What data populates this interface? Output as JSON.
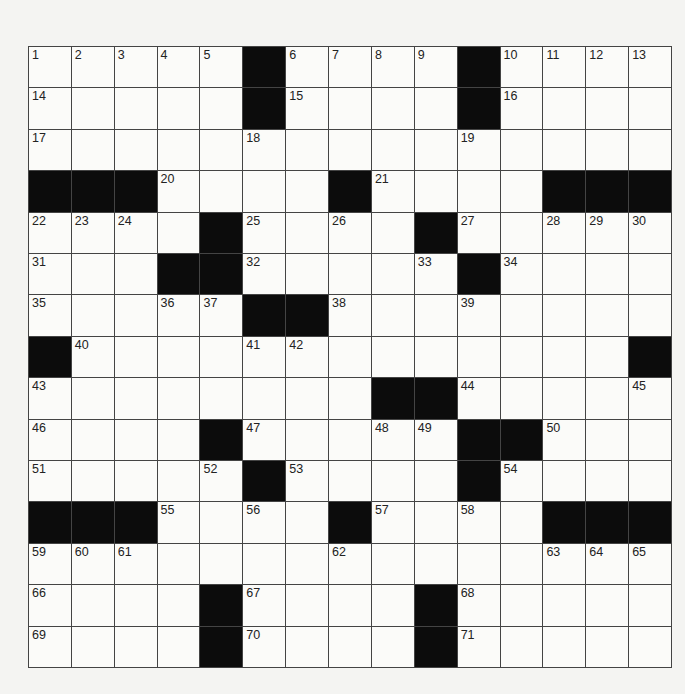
{
  "puzzle": {
    "rows": 15,
    "cols": 15,
    "blacks": [
      [
        5,
        10
      ],
      [
        5,
        10
      ],
      [],
      [
        0,
        1,
        2,
        7,
        12,
        13,
        14
      ],
      [
        4,
        9
      ],
      [
        3,
        4,
        10
      ],
      [
        5,
        6
      ],
      [
        0,
        14
      ],
      [
        8,
        9
      ],
      [
        4,
        10,
        11
      ],
      [
        5,
        10
      ],
      [
        0,
        1,
        2,
        7,
        12,
        13,
        14
      ],
      [],
      [
        4,
        9
      ],
      [
        4,
        9
      ]
    ],
    "numbers": [
      [
        [
          0,
          1
        ],
        [
          1,
          2
        ],
        [
          2,
          3
        ],
        [
          3,
          4
        ],
        [
          4,
          5
        ],
        [
          6,
          6
        ],
        [
          7,
          7
        ],
        [
          8,
          8
        ],
        [
          9,
          9
        ],
        [
          11,
          10
        ],
        [
          12,
          11
        ],
        [
          13,
          12
        ],
        [
          14,
          13
        ]
      ],
      [
        [
          0,
          14
        ],
        [
          6,
          15
        ],
        [
          11,
          16
        ]
      ],
      [
        [
          0,
          17
        ],
        [
          5,
          18
        ],
        [
          10,
          19
        ]
      ],
      [
        [
          3,
          20
        ],
        [
          8,
          21
        ]
      ],
      [
        [
          0,
          22
        ],
        [
          1,
          23
        ],
        [
          2,
          24
        ],
        [
          5,
          25
        ],
        [
          7,
          26
        ],
        [
          10,
          27
        ],
        [
          12,
          28
        ],
        [
          13,
          29
        ],
        [
          14,
          30
        ]
      ],
      [
        [
          0,
          31
        ],
        [
          5,
          32
        ],
        [
          9,
          33
        ],
        [
          11,
          34
        ]
      ],
      [
        [
          0,
          35
        ],
        [
          3,
          36
        ],
        [
          4,
          37
        ],
        [
          7,
          38
        ],
        [
          10,
          39
        ]
      ],
      [
        [
          1,
          40
        ],
        [
          5,
          41
        ],
        [
          6,
          42
        ]
      ],
      [
        [
          0,
          43
        ],
        [
          10,
          44
        ],
        [
          14,
          45
        ]
      ],
      [
        [
          0,
          46
        ],
        [
          5,
          47
        ],
        [
          8,
          48
        ],
        [
          9,
          49
        ],
        [
          12,
          50
        ]
      ],
      [
        [
          0,
          51
        ],
        [
          4,
          52
        ],
        [
          6,
          53
        ],
        [
          11,
          54
        ]
      ],
      [
        [
          3,
          55
        ],
        [
          5,
          56
        ],
        [
          8,
          57
        ],
        [
          10,
          58
        ]
      ],
      [
        [
          0,
          59
        ],
        [
          1,
          60
        ],
        [
          2,
          61
        ],
        [
          7,
          62
        ],
        [
          12,
          63
        ],
        [
          13,
          64
        ],
        [
          14,
          65
        ]
      ],
      [
        [
          0,
          66
        ],
        [
          5,
          67
        ],
        [
          10,
          68
        ]
      ],
      [
        [
          0,
          69
        ],
        [
          5,
          70
        ],
        [
          10,
          71
        ]
      ]
    ]
  },
  "colors": {
    "black_square": "#0c0c0c",
    "white_square": "#fbfbf9",
    "grid_line": "#444444"
  }
}
